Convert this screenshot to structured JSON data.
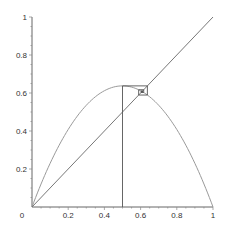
{
  "chart_data": {
    "type": "line",
    "title": "",
    "xlabel": "",
    "ylabel": "",
    "xlim": [
      0,
      1
    ],
    "ylim": [
      0,
      1
    ],
    "grid": false,
    "legend": null,
    "x_ticks": [
      "0",
      "0.2",
      "0.4",
      "0.6",
      "0.8",
      "1"
    ],
    "y_ticks": [
      "0.2",
      "0.4",
      "0.6",
      "0.8",
      "1"
    ],
    "series": [
      {
        "name": "logistic map f(x)=r x (1-x)",
        "r": 2.55,
        "x": [
          0,
          0.1,
          0.2,
          0.3,
          0.4,
          0.5,
          0.6,
          0.7,
          0.8,
          0.9,
          1
        ],
        "values": [
          0,
          0.2295,
          0.408,
          0.5355,
          0.612,
          0.6375,
          0.612,
          0.5355,
          0.408,
          0.2295,
          0
        ],
        "color": "#9a9a9a"
      },
      {
        "name": "y = x",
        "x": [
          0,
          1
        ],
        "values": [
          0,
          1
        ],
        "color": "#777777"
      },
      {
        "name": "cobweb",
        "start_x": 0.5,
        "iterations": 8,
        "color": "#555555"
      }
    ]
  }
}
